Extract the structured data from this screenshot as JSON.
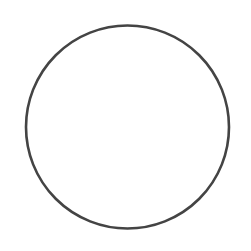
{
  "diagram": {
    "shapes": [
      {
        "type": "circle",
        "cx": 127.5,
        "cy": 127,
        "r": 101.5,
        "stroke": "#444444",
        "stroke_width": 2.6,
        "fill": "none"
      }
    ],
    "background": "#ffffff"
  }
}
